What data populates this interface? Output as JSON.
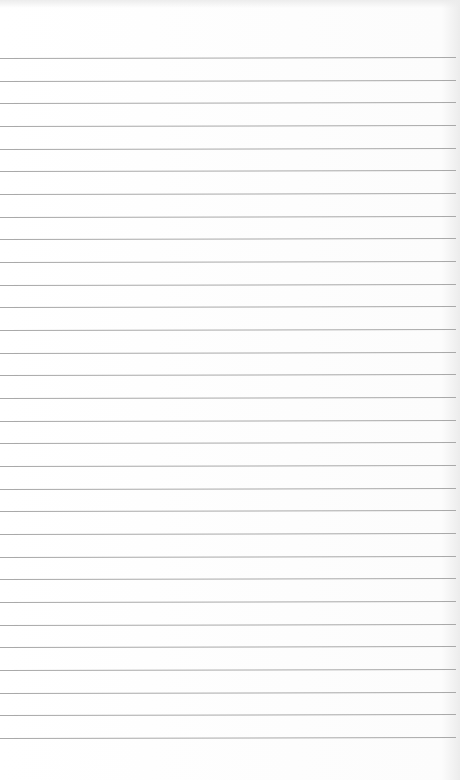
{
  "page": {
    "type": "lined-paper",
    "background": "#fdfdfd",
    "line_color": "#a9a9a9",
    "line_count": 31,
    "first_line_y": 58,
    "line_spacing": 22.67
  }
}
